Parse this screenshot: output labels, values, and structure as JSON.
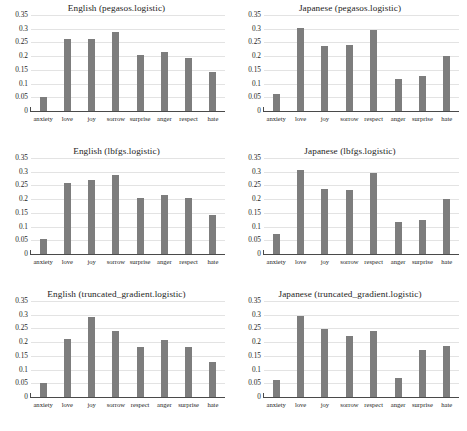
{
  "figure": {
    "bar_color": "#7d7d7d",
    "gridline_color": "#e3e3e3",
    "axis_color": "#4a4a4a",
    "background": "#ffffff"
  },
  "chart_data": [
    {
      "type": "bar",
      "title": "English (pegasos.logistic)",
      "xlabel": "",
      "ylabel": "",
      "ylim": [
        0,
        0.35
      ],
      "yticks": [
        "0",
        "0.05",
        "0.1",
        "0.15",
        "0.2",
        "0.25",
        "0.3",
        "0.35"
      ],
      "ytick_values": [
        0,
        0.05,
        0.1,
        0.15,
        0.2,
        0.25,
        0.3,
        0.35
      ],
      "grid": true,
      "legend": "none",
      "categories": [
        "anxiety",
        "love",
        "joy",
        "sorrow",
        "surprise",
        "anger",
        "respect",
        "hate"
      ],
      "values": [
        0.052,
        0.261,
        0.262,
        0.288,
        0.205,
        0.216,
        0.195,
        0.141
      ]
    },
    {
      "type": "bar",
      "title": "Japanese (pegasos.logistic)",
      "xlabel": "",
      "ylabel": "",
      "ylim": [
        0,
        0.35
      ],
      "yticks": [
        "0",
        "0.05",
        "0.1",
        "0.15",
        "0.2",
        "0.25",
        "0.3",
        "0.35"
      ],
      "ytick_values": [
        0,
        0.05,
        0.1,
        0.15,
        0.2,
        0.25,
        0.3,
        0.35
      ],
      "grid": true,
      "legend": "none",
      "categories": [
        "anxiety",
        "love",
        "joy",
        "sorrow",
        "respect",
        "anger",
        "surprise",
        "hate"
      ],
      "values": [
        0.061,
        0.302,
        0.238,
        0.241,
        0.296,
        0.118,
        0.127,
        0.201
      ]
    },
    {
      "type": "bar",
      "title": "English (lbfgs.logistic)",
      "xlabel": "",
      "ylabel": "",
      "ylim": [
        0,
        0.35
      ],
      "yticks": [
        "0",
        "0.05",
        "0.1",
        "0.15",
        "0.2",
        "0.25",
        "0.3",
        "0.35"
      ],
      "ytick_values": [
        0,
        0.05,
        0.1,
        0.15,
        0.2,
        0.25,
        0.3,
        0.35
      ],
      "grid": true,
      "legend": "none",
      "categories": [
        "anxiety",
        "love",
        "joy",
        "sorrow",
        "surprise",
        "anger",
        "respect",
        "hate"
      ],
      "values": [
        0.054,
        0.259,
        0.27,
        0.287,
        0.203,
        0.215,
        0.203,
        0.142
      ]
    },
    {
      "type": "bar",
      "title": "Japanese (lbfgs.logistic)",
      "xlabel": "",
      "ylabel": "",
      "ylim": [
        0,
        0.35
      ],
      "yticks": [
        "0",
        "0.05",
        "0.1",
        "0.15",
        "0.2",
        "0.25",
        "0.3",
        "0.35"
      ],
      "ytick_values": [
        0,
        0.05,
        0.1,
        0.15,
        0.2,
        0.25,
        0.3,
        0.35
      ],
      "grid": true,
      "legend": "none",
      "categories": [
        "anxiety",
        "love",
        "joy",
        "sorrow",
        "respect",
        "anger",
        "surprise",
        "hate"
      ],
      "values": [
        0.073,
        0.308,
        0.236,
        0.233,
        0.297,
        0.117,
        0.125,
        0.199
      ]
    },
    {
      "type": "bar",
      "title": "English (truncated_gradient.logistic)",
      "xlabel": "",
      "ylabel": "",
      "ylim": [
        0,
        0.35
      ],
      "yticks": [
        "0",
        "0.05",
        "0.1",
        "0.15",
        "0.2",
        "0.25",
        "0.3",
        "0.35"
      ],
      "ytick_values": [
        0,
        0.05,
        0.1,
        0.15,
        0.2,
        0.25,
        0.3,
        0.35
      ],
      "grid": true,
      "legend": "none",
      "categories": [
        "anxiety",
        "love",
        "joy",
        "sorrow",
        "respect",
        "anger",
        "surprise",
        "hate"
      ],
      "values": [
        0.05,
        0.21,
        0.292,
        0.241,
        0.182,
        0.207,
        0.183,
        0.128
      ]
    },
    {
      "type": "bar",
      "title": "Japanese (truncated_gradient.logistic)",
      "xlabel": "",
      "ylabel": "",
      "ylim": [
        0,
        0.35
      ],
      "yticks": [
        "0",
        "0.05",
        "0.1",
        "0.15",
        "0.2",
        "0.25",
        "0.3",
        "0.35"
      ],
      "ytick_values": [
        0,
        0.05,
        0.1,
        0.15,
        0.2,
        0.25,
        0.3,
        0.35
      ],
      "grid": true,
      "legend": "none",
      "categories": [
        "anxiety",
        "love",
        "joy",
        "sorrow",
        "respect",
        "anger",
        "surprise",
        "hate"
      ],
      "values": [
        0.061,
        0.295,
        0.247,
        0.224,
        0.241,
        0.07,
        0.172,
        0.187
      ]
    }
  ]
}
